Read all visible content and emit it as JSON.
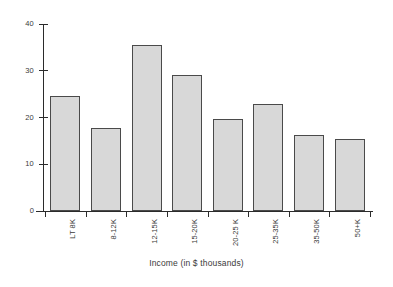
{
  "chart_data": {
    "type": "bar",
    "title": "",
    "xlabel": "Income (in $ thousands)",
    "ylabel": "",
    "categories": [
      "LT 8K",
      "8-12K",
      "12-15K",
      "15-20K",
      "20-25 K",
      "25-35K",
      "35-50K",
      "50+K"
    ],
    "values": [
      24.5,
      17.7,
      35.5,
      29.0,
      19.6,
      22.8,
      16.2,
      15.3
    ],
    "ylim": [
      0,
      40
    ],
    "yticks": [
      0,
      10,
      20,
      30,
      40
    ],
    "ytick_labels": [
      "0",
      "10",
      "20",
      "30",
      "40"
    ],
    "grid": false,
    "legend": null,
    "bar_fill": "#d8d8d8",
    "bar_edge": "#4a4a4a",
    "axis_color": "#2b2b2b",
    "background": "#ffffff"
  }
}
